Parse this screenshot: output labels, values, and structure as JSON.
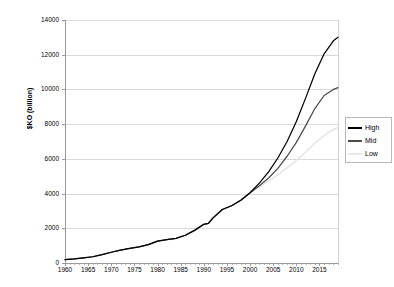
{
  "chart_data": {
    "type": "line",
    "title": "",
    "xlabel": "",
    "ylabel": "$KO (billion)",
    "xlim": [
      1960,
      2019
    ],
    "ylim": [
      0,
      14000
    ],
    "grid": "horizontal",
    "legend_position": "right",
    "x_ticks": [
      "1960",
      "1965",
      "1970",
      "1975",
      "1980",
      "1985",
      "1990",
      "1995",
      "2000",
      "2005",
      "2010",
      "2015"
    ],
    "x_tick_values": [
      1960,
      1965,
      1970,
      1975,
      1980,
      1985,
      1990,
      1995,
      2000,
      2005,
      2010,
      2015
    ],
    "y_ticks": [
      "0",
      "2000",
      "4000",
      "6000",
      "8000",
      "10000",
      "12000",
      "14000"
    ],
    "y_tick_values": [
      0,
      2000,
      4000,
      6000,
      8000,
      10000,
      12000,
      14000
    ],
    "x": [
      1960,
      1962,
      1964,
      1966,
      1968,
      1970,
      1972,
      1974,
      1976,
      1978,
      1980,
      1982,
      1984,
      1986,
      1988,
      1990,
      1991,
      1992,
      1994,
      1996,
      1998,
      2000,
      2002,
      2004,
      2006,
      2008,
      2010,
      2012,
      2014,
      2016,
      2018,
      2019
    ],
    "series": [
      {
        "name": "High",
        "color": "#000000",
        "values": [
          200,
          240,
          300,
          360,
          480,
          620,
          740,
          840,
          930,
          1060,
          1260,
          1350,
          1420,
          1600,
          1880,
          2230,
          2280,
          2600,
          3080,
          3300,
          3620,
          4050,
          4600,
          5250,
          6050,
          7000,
          8150,
          9500,
          10900,
          12050,
          12800,
          13000
        ]
      },
      {
        "name": "Mid",
        "color": "#4a4a4a",
        "values": [
          200,
          240,
          300,
          360,
          480,
          620,
          740,
          840,
          930,
          1060,
          1260,
          1350,
          1420,
          1600,
          1880,
          2230,
          2280,
          2600,
          3080,
          3300,
          3620,
          4050,
          4450,
          4900,
          5450,
          6150,
          6950,
          7900,
          8900,
          9650,
          10000,
          10100
        ]
      },
      {
        "name": "Low",
        "color": "#e2e2e2",
        "values": [
          200,
          240,
          300,
          360,
          480,
          620,
          740,
          840,
          930,
          1060,
          1260,
          1350,
          1420,
          1600,
          1880,
          2230,
          2280,
          2600,
          3080,
          3300,
          3620,
          4050,
          4380,
          4720,
          5080,
          5480,
          5900,
          6400,
          6900,
          7350,
          7700,
          7800
        ]
      }
    ],
    "legend": [
      {
        "label": "High",
        "color": "#000000"
      },
      {
        "label": "Mid",
        "color": "#4a4a4a"
      },
      {
        "label": "Low",
        "color": "#e8e8e8"
      }
    ]
  }
}
